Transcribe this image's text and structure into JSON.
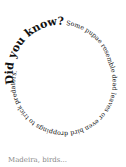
{
  "spiral": {
    "heading": "Did you know?",
    "body": " Some pupae resemble dead leaves or even bird droppings to trick predators.",
    "text_color": "#111111"
  },
  "caption": {
    "text": "Madeira, birds..."
  }
}
